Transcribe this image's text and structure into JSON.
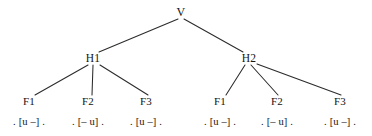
{
  "diagram": {
    "line_color": "#2b2b2b",
    "text_color": "#141414",
    "root": {
      "label": "V",
      "x": 181,
      "y": 12
    },
    "levels": {
      "half_line_label_1": "H1",
      "half_line_label_2": "H2",
      "foot_label_1": "F1",
      "foot_label_2": "F2",
      "foot_label_3": "F3"
    },
    "half_lines": [
      {
        "label": "H1",
        "x": 93,
        "y": 58
      },
      {
        "label": "H2",
        "x": 249,
        "y": 58
      }
    ],
    "feet": [
      {
        "label": "F1",
        "x": 29,
        "y": 101,
        "parent": "H1"
      },
      {
        "label": "F2",
        "x": 88,
        "y": 101,
        "parent": "H1"
      },
      {
        "label": "F3",
        "x": 146,
        "y": 101,
        "parent": "H1"
      },
      {
        "label": "F1",
        "x": 220,
        "y": 101,
        "parent": "H2"
      },
      {
        "label": "F2",
        "x": 277,
        "y": 101,
        "parent": "H2"
      },
      {
        "label": "F3",
        "x": 340,
        "y": 101,
        "parent": "H2"
      }
    ],
    "terminals": [
      {
        "left_dot": ".",
        "open": "[",
        "first": "u",
        "second": "–",
        "close": "]",
        "right_dot": ".",
        "x": 29,
        "y": 122
      },
      {
        "left_dot": ".",
        "open": "[",
        "first": "–",
        "second": "u",
        "close": "]",
        "right_dot": ".",
        "x": 88,
        "y": 122
      },
      {
        "left_dot": ".",
        "open": "[",
        "first": "u",
        "second": "–",
        "close": "]",
        "right_dot": ".",
        "x": 146,
        "y": 122
      },
      {
        "left_dot": ".",
        "open": "[",
        "first": "u",
        "second": "–",
        "close": "]",
        "right_dot": ".",
        "x": 220,
        "y": 122
      },
      {
        "left_dot": ".",
        "open": "[",
        "first": "–",
        "second": "u",
        "close": "]",
        "right_dot": ".",
        "x": 277,
        "y": 122
      },
      {
        "left_dot": ".",
        "open": "[",
        "first": "u",
        "second": "–",
        "close": "]",
        "right_dot": ".",
        "x": 340,
        "y": 122
      }
    ],
    "edges": [
      {
        "name": "edge-v-h1",
        "x1": 178,
        "y1": 19,
        "x2": 99,
        "y2": 52
      },
      {
        "name": "edge-v-h2",
        "x1": 184,
        "y1": 19,
        "x2": 243,
        "y2": 52
      },
      {
        "name": "edge-h1-f1",
        "x1": 88,
        "y1": 65,
        "x2": 35,
        "y2": 95
      },
      {
        "name": "edge-h1-f2",
        "x1": 93,
        "y1": 65,
        "x2": 92,
        "y2": 95
      },
      {
        "name": "edge-h1-f3",
        "x1": 100,
        "y1": 65,
        "x2": 148,
        "y2": 95
      },
      {
        "name": "edge-h2-f1",
        "x1": 245,
        "y1": 65,
        "x2": 226,
        "y2": 95
      },
      {
        "name": "edge-h2-f2",
        "x1": 251,
        "y1": 65,
        "x2": 278,
        "y2": 95
      },
      {
        "name": "edge-h2-f3",
        "x1": 257,
        "y1": 64,
        "x2": 341,
        "y2": 95
      }
    ]
  }
}
